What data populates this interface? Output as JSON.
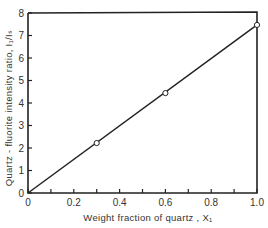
{
  "chart_data": {
    "type": "line",
    "title": "",
    "xlabel": "Weight fraction of quartz , X₁",
    "ylabel": "Quartz - fluorite intensity ratio, I₁/Iₛ",
    "xlim": [
      0,
      1.0
    ],
    "ylim": [
      0,
      8
    ],
    "x_ticks": [
      0,
      0.1,
      0.2,
      0.3,
      0.4,
      0.5,
      0.6,
      0.7,
      0.8,
      0.9,
      1.0
    ],
    "x_tick_labels": [
      "0",
      "0.2",
      "0.4",
      "0.6",
      "0.8",
      "1.0"
    ],
    "x_tick_label_values": [
      0,
      0.2,
      0.4,
      0.6,
      0.8,
      1.0
    ],
    "y_ticks": [
      0,
      1,
      2,
      3,
      4,
      5,
      6,
      7,
      8
    ],
    "y_tick_labels": [
      "0",
      "1",
      "2",
      "3",
      "4",
      "5",
      "6",
      "7",
      "8"
    ],
    "grid": false,
    "legend": null,
    "series": [
      {
        "name": "calibration line",
        "style": "line",
        "x": [
          0,
          1.0
        ],
        "y": [
          0,
          7.47
        ]
      },
      {
        "name": "measured points",
        "style": "open-circle-markers",
        "x": [
          0.3,
          0.6,
          1.0
        ],
        "y": [
          2.22,
          4.44,
          7.47
        ]
      }
    ],
    "colors": {
      "line": "#222222",
      "axes": "#222222",
      "text": "#333333",
      "background": "#ffffff"
    }
  }
}
